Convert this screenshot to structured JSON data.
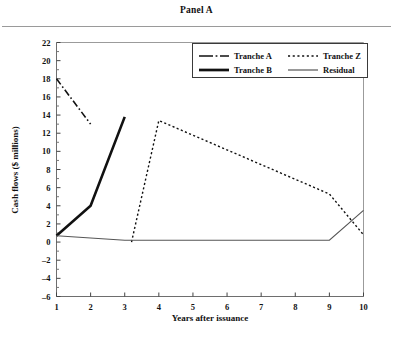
{
  "panel": {
    "title": "Panel A"
  },
  "chart_data": {
    "type": "line",
    "title": "Panel A",
    "xlabel": "Years after issuance",
    "ylabel": "Cash flows ($ millions)",
    "xlim": [
      1,
      10
    ],
    "ylim": [
      -6,
      22
    ],
    "xticks": [
      "1",
      "2",
      "3",
      "4",
      "5",
      "6",
      "7",
      "8",
      "9",
      "10"
    ],
    "yticks": [
      "22",
      "20",
      "18",
      "16",
      "14",
      "12",
      "10",
      "8",
      "6",
      "4",
      "2",
      "0",
      "-2",
      "-4",
      "-6"
    ],
    "grid": false,
    "legend_position": "top-right",
    "series": [
      {
        "name": "Tranche A",
        "style": "dash-dot",
        "width": 1.6,
        "color": "#111111",
        "x": [
          1,
          2
        ],
        "values": [
          18.0,
          13.0
        ]
      },
      {
        "name": "Tranche Z",
        "style": "dotted",
        "width": 1.4,
        "color": "#111111",
        "x": [
          3.2,
          4,
          9,
          10
        ],
        "values": [
          0.0,
          13.4,
          5.3,
          0.8
        ]
      },
      {
        "name": "Tranche B",
        "style": "solid",
        "width": 2.6,
        "color": "#111111",
        "x": [
          1,
          2,
          3
        ],
        "values": [
          0.7,
          4.0,
          13.8
        ]
      },
      {
        "name": "Residual",
        "style": "solid",
        "width": 1.1,
        "color": "#555555",
        "x": [
          1,
          3,
          9,
          10
        ],
        "values": [
          0.7,
          0.2,
          0.2,
          3.5
        ]
      }
    ]
  },
  "legend": {
    "entries": [
      {
        "label": "Tranche A",
        "sample": "dash-dot"
      },
      {
        "label": "Tranche Z",
        "sample": "dotted"
      },
      {
        "label": "Tranche B",
        "sample": "thick-solid"
      },
      {
        "label": "Residual",
        "sample": "thin-solid"
      }
    ]
  }
}
